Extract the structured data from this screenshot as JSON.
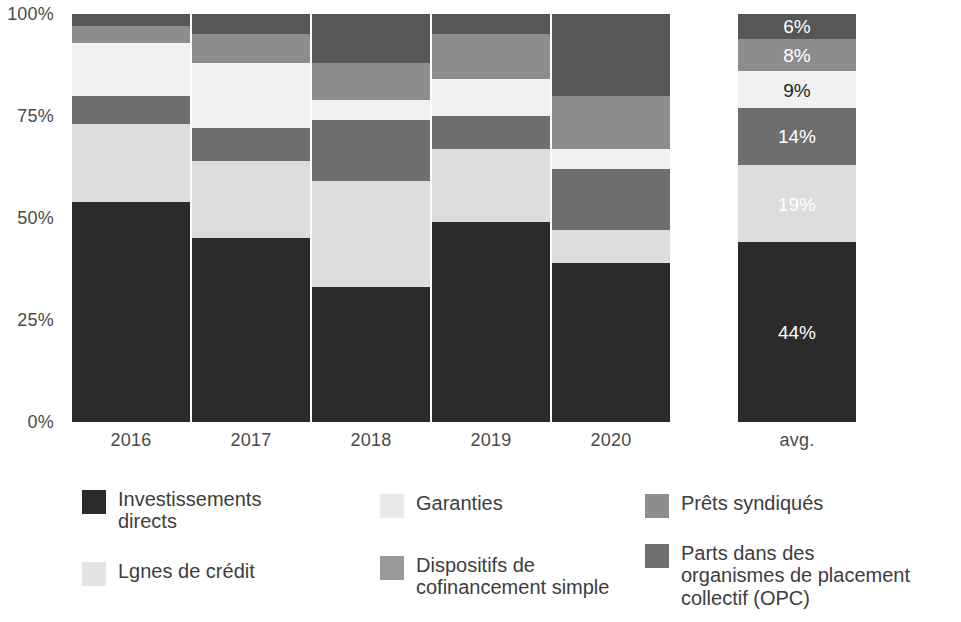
{
  "chart_data": {
    "type": "bar",
    "stacked": true,
    "stack_mode": "percent",
    "title": "",
    "subtitle": "",
    "xlabel": "",
    "ylabel": "",
    "ylim": [
      0,
      100
    ],
    "grid": false,
    "legend_position": "bottom",
    "categories": [
      "2016",
      "2017",
      "2018",
      "2019",
      "2020",
      "avg."
    ],
    "y_ticks": [
      "0%",
      "25%",
      "50%",
      "75%",
      "100%"
    ],
    "y_tick_values": [
      0,
      25,
      50,
      75,
      100
    ],
    "series": [
      {
        "name": "Investissements directs",
        "color": "#2b2b2b",
        "label_on": "dark",
        "values": [
          54,
          45,
          33,
          49,
          39,
          44
        ]
      },
      {
        "name": "Lgnes de crédit",
        "color": "#dcdcdc",
        "label_on": "light-gray",
        "values": [
          19,
          19,
          26,
          18,
          8,
          19
        ]
      },
      {
        "name": "Dispositifs de cofinancement simple",
        "color": "#6e6e6e",
        "label_on": "dark",
        "values": [
          7,
          8,
          15,
          8,
          15,
          14
        ]
      },
      {
        "name": "Garanties",
        "color": "#f1f1f1",
        "label_on": "light",
        "values": [
          13,
          16,
          5,
          9,
          5,
          9
        ]
      },
      {
        "name": "Prêts syndiqués",
        "color": "#8d8d8d",
        "label_on": "dark",
        "values": [
          4,
          7,
          9,
          11,
          13,
          8
        ]
      },
      {
        "name": "Parts dans des organismes de placement collectif (OPC)",
        "color": "#575757",
        "label_on": "dark",
        "values": [
          3,
          5,
          12,
          5,
          20,
          6
        ]
      }
    ],
    "value_labels": {
      "shown_for_category": "avg.",
      "labels": [
        "44%",
        "19%",
        "14%",
        "9%",
        "8%",
        "6%"
      ]
    }
  },
  "axis": {
    "y_ticks": [
      {
        "label": "100%",
        "value": 100
      },
      {
        "label": "75%",
        "value": 75
      },
      {
        "label": "50%",
        "value": 50
      },
      {
        "label": "25%",
        "value": 25
      },
      {
        "label": "0%",
        "value": 0
      }
    ],
    "x_ticks": [
      {
        "label": "2016"
      },
      {
        "label": "2017"
      },
      {
        "label": "2018"
      },
      {
        "label": "2019"
      },
      {
        "label": "2020"
      },
      {
        "label": "avg."
      }
    ]
  },
  "legend": {
    "items": [
      {
        "label": "Investissements\ndirects",
        "color": "#2b2b2b"
      },
      {
        "label": "Garanties",
        "color": "#e9e9e9"
      },
      {
        "label": "Prêts syndiqués",
        "color": "#8d8d8d"
      },
      {
        "label": "Lgnes de crédit",
        "color": "#e4e4e4"
      },
      {
        "label": "Dispositifs de\ncofinancement simple",
        "color": "#9a9a9a"
      },
      {
        "label": "Parts dans des\norganismes de placement\ncollectif (OPC)",
        "color": "#707070"
      }
    ]
  }
}
